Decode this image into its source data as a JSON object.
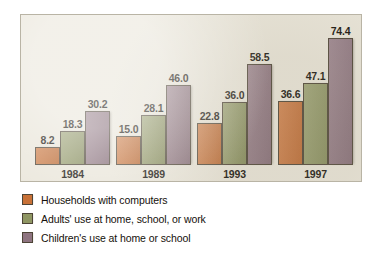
{
  "chart_data": {
    "type": "bar",
    "title": "",
    "subtitle": "",
    "xlabel": "",
    "ylabel": "",
    "categories": [
      "1984",
      "1989",
      "1993",
      "1997"
    ],
    "ylim": [
      0,
      80
    ],
    "grid": false,
    "axis_visible": false,
    "value_labels_shown": true,
    "legend_position": "below",
    "series": [
      {
        "name": "Households with computers",
        "color": "#c87137",
        "values": [
          8.2,
          18.3,
          22.8,
          36.6
        ],
        "labels": [
          "8.2",
          "22.8",
          "22.8",
          "36.6"
        ]
      },
      {
        "name": "Adults' use at home, school, or work",
        "color": "#8f9663",
        "values": [
          18.3,
          28.1,
          36.0,
          47.1
        ],
        "labels": [
          "18.3",
          "28.1",
          "36.0",
          "47.1"
        ]
      },
      {
        "name": "Children's use at home or school",
        "color": "#8e7480",
        "values": [
          30.2,
          46.0,
          58.5,
          74.4
        ],
        "labels": [
          "30.2",
          "46.0",
          "58.5",
          "74.4"
        ]
      }
    ],
    "points": [
      {
        "category": "1984",
        "series": "Households with computers",
        "value": 8.2,
        "label": "8.2"
      },
      {
        "category": "1984",
        "series": "Adults' use at home, school, or work",
        "value": 18.3,
        "label": "18.3"
      },
      {
        "category": "1984",
        "series": "Children's use at home or school",
        "value": 30.2,
        "label": "30.2"
      },
      {
        "category": "1989",
        "series": "Households with computers",
        "value": 15.0,
        "label": "15.0"
      },
      {
        "category": "1989",
        "series": "Adults' use at home, school, or work",
        "value": 28.1,
        "label": "28.1"
      },
      {
        "category": "1989",
        "series": "Children's use at home or school",
        "value": 46.0,
        "label": "46.0"
      },
      {
        "category": "1993",
        "series": "Households with computers",
        "value": 22.8,
        "label": "22.8"
      },
      {
        "category": "1993",
        "series": "Adults' use at home, school, or work",
        "value": 36.0,
        "label": "36.0"
      },
      {
        "category": "1993",
        "series": "Children's use at home or school",
        "value": 58.5,
        "label": "58.5"
      },
      {
        "category": "1997",
        "series": "Households with computers",
        "value": 36.6,
        "label": "36.6"
      },
      {
        "category": "1997",
        "series": "Adults' use at home, school, or work",
        "value": 47.1,
        "label": "47.1"
      },
      {
        "category": "1997",
        "series": "Children's use at home or school",
        "value": 74.4,
        "label": "74.4"
      }
    ]
  },
  "panel": {
    "background_color": "#e9e5d9",
    "border_color": "#b9b4a5"
  },
  "legend": {
    "items": [
      {
        "label": "Households with computers",
        "color": "#c87137"
      },
      {
        "label": "Adults' use at home, school, or work",
        "color": "#8f9663"
      },
      {
        "label": "Children's use at home or school",
        "color": "#8e7480"
      }
    ]
  }
}
